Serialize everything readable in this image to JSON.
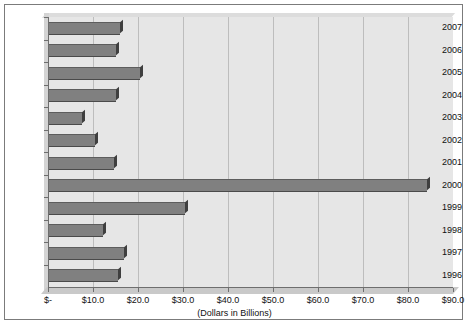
{
  "chart_data": {
    "type": "bar",
    "orientation": "horizontal",
    "title": "",
    "xlabel": "(Dollars in Billions)",
    "ylabel": "",
    "categories": [
      "2007",
      "2006",
      "2005",
      "2004",
      "2003",
      "2002",
      "2001",
      "2000",
      "1999",
      "1998",
      "1997",
      "1996"
    ],
    "values": [
      16.1,
      15.2,
      20.4,
      15.2,
      7.6,
      10.4,
      14.7,
      84.2,
      30.4,
      12.2,
      16.9,
      15.6
    ],
    "series": [
      {
        "name": "Dollars in Billions",
        "values": [
          16.1,
          15.2,
          20.4,
          15.2,
          7.6,
          10.4,
          14.7,
          84.2,
          30.4,
          12.2,
          16.9,
          15.6
        ]
      }
    ],
    "xlim": [
      0,
      90
    ],
    "xtick_values": [
      0,
      10,
      20,
      30,
      40,
      50,
      60,
      70,
      80,
      90
    ],
    "xtick_labels": [
      "$-",
      "$10.0",
      "$20.0",
      "$30.0",
      "$40.0",
      "$50.0",
      "$60.0",
      "$70.0",
      "$80.0",
      "$90.0"
    ],
    "grid": "vertical",
    "legend": "none",
    "colors": {
      "bar": "#808080",
      "bar_edge": "#4a4a4a",
      "plot_background": "#e6e6e6",
      "gridline": "#bdbdbd",
      "axis": "#6e6e6e",
      "frame": "#7b7b7b",
      "text": "#111111"
    }
  },
  "axis": {
    "caption": "(Dollars in Billions)"
  }
}
